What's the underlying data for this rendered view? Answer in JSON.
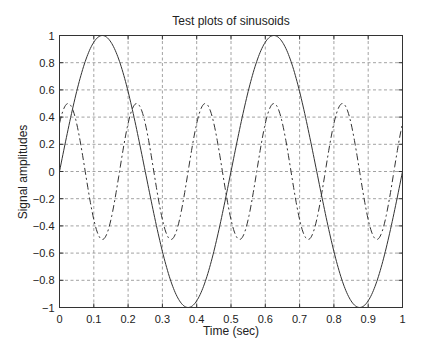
{
  "chart_data": {
    "type": "line",
    "title": "Test plots of sinusoids",
    "xlabel": "Time (sec)",
    "ylabel": "Signal amplitudes",
    "xlim": [
      0,
      1
    ],
    "ylim": [
      -1,
      1
    ],
    "grid": true,
    "legend": null,
    "x_ticks": [
      "0",
      "0.1",
      "0.2",
      "0.3",
      "0.4",
      "0.5",
      "0.6",
      "0.7",
      "0.8",
      "0.9",
      "1"
    ],
    "y_ticks": [
      "1",
      "0.8",
      "0.6",
      "0.4",
      "0.2",
      "0",
      "−0.2",
      "−0.4",
      "−0.6",
      "−0.8",
      "−1"
    ],
    "series": [
      {
        "name": "sin(2π·2t)",
        "style": "solid",
        "amplitude": 1.0,
        "frequency_hz": 2,
        "phase_offset_sec": 0.125,
        "x": [
          0,
          0.0625,
          0.125,
          0.1875,
          0.25,
          0.3125,
          0.375,
          0.4375,
          0.5,
          0.5625,
          0.625,
          0.6875,
          0.75,
          0.8125,
          0.875,
          0.9375,
          1.0
        ],
        "values": [
          0,
          0.71,
          1.0,
          0.71,
          0,
          -0.71,
          -1.0,
          -0.71,
          0,
          0.71,
          1.0,
          0.71,
          0,
          -0.71,
          -1.0,
          -0.71,
          0
        ]
      },
      {
        "name": "0.5·cos(2π·5(t−0.025))",
        "style": "dash-dot",
        "amplitude": 0.5,
        "frequency_hz": 5,
        "phase_offset_sec": 0.025,
        "x": [
          0,
          0.025,
          0.075,
          0.125,
          0.175,
          0.225,
          0.275,
          0.325,
          0.375,
          0.425,
          0.475,
          0.525,
          0.575,
          0.625,
          0.675,
          0.725,
          0.775,
          0.825,
          0.875,
          0.925,
          0.975,
          1.0
        ],
        "values": [
          0.35,
          0.5,
          0,
          -0.5,
          0,
          0.5,
          0,
          -0.5,
          0,
          0.5,
          0,
          -0.5,
          0,
          0.5,
          0,
          -0.5,
          0,
          0.5,
          0,
          -0.5,
          0,
          0.35
        ]
      }
    ]
  }
}
